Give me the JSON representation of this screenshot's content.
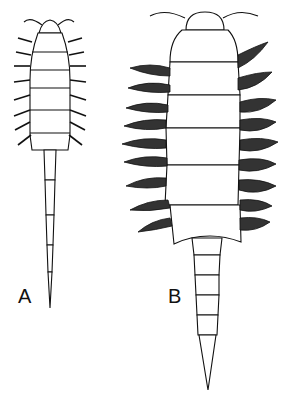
{
  "figure": {
    "panels": [
      {
        "label": "A",
        "description": "slender larva with long segmented tail, simple lateral spines"
      },
      {
        "label": "B",
        "description": "broad larva with feathered lateral gills and tapered segmented tail"
      }
    ]
  },
  "colors": {
    "ink": "#111111",
    "background": "#ffffff"
  }
}
